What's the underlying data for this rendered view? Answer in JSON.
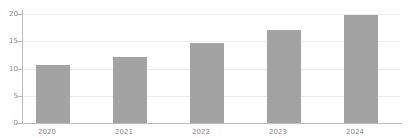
{
  "chart_data": {
    "type": "bar",
    "title": "",
    "subtitle": "",
    "xlabel": "",
    "ylabel": "",
    "categories": [
      "2020",
      "2021",
      "2022",
      "2023",
      "2024"
    ],
    "values": [
      10.6,
      12.1,
      14.7,
      17.0,
      19.8
    ],
    "series": [
      {
        "name": "",
        "values": [
          10.6,
          12.1,
          14.7,
          17.0,
          19.8
        ]
      }
    ],
    "ylim": [
      0,
      20
    ],
    "xlim": null,
    "y_ticks": [
      0,
      5,
      10,
      15,
      20
    ],
    "y_tick_labels": [
      "0",
      "5",
      "10",
      "15",
      "20"
    ],
    "x_tick_labels": [
      "2020",
      "2021",
      "2022",
      "2023",
      "2024"
    ],
    "grid": true,
    "grid_axis": "y",
    "legend": false,
    "legend_position": "none",
    "annotations": [],
    "colors": {
      "bar_fill": "#a3a3a3",
      "gridline": "#ececec",
      "axis_line": "#bdbdbd",
      "tick_label": "#8a8a8a",
      "background": "#ffffff"
    }
  }
}
